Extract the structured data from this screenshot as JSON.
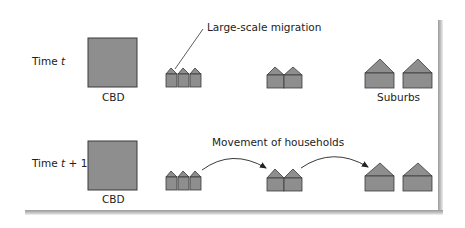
{
  "diagram": {
    "colors": {
      "fill": "#8e8e8e",
      "stroke": "#3a3a3a",
      "text": "#222222"
    },
    "rows": [
      {
        "time_label_prefix": "Time ",
        "time_label_var": "t",
        "time_label_suffix": "",
        "cbd_label": "CBD",
        "suburbs_label": "Suburbs",
        "annotation": "Large-scale migration"
      },
      {
        "time_label_prefix": "Time ",
        "time_label_var": "t",
        "time_label_suffix": " + 1",
        "cbd_label": "CBD",
        "annotation": "Movement of households"
      }
    ]
  }
}
